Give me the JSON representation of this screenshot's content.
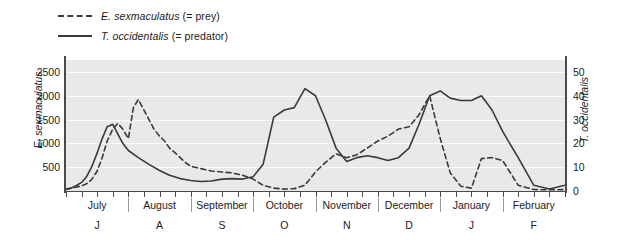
{
  "legend": {
    "items": [
      {
        "key": "dashed",
        "species": "E. sexmaculatus",
        "role": "(= prey)",
        "color": "#3a3a3a"
      },
      {
        "key": "solid",
        "species": "T. occidentalis",
        "role": "(= predator)",
        "color": "#3a3a3a"
      }
    ]
  },
  "chart_data": {
    "type": "line",
    "title": "",
    "xlabel": "",
    "ylabel": "E. sexmaculatus",
    "ylabel_right": "T. occidentalis",
    "ylim": [
      0,
      2750
    ],
    "ylim_right": [
      0,
      55
    ],
    "yticks": [
      500,
      1000,
      1500,
      2000,
      2500
    ],
    "yticks_right": [
      0,
      10,
      20,
      30,
      40,
      50
    ],
    "grid": true,
    "legend_position": "top-left",
    "categories": [
      "July",
      "August",
      "September",
      "October",
      "November",
      "December",
      "January",
      "February"
    ],
    "category_initials": [
      "J",
      "A",
      "S",
      "O",
      "N",
      "D",
      "J",
      "F"
    ],
    "x_tick_count_per_month": 4,
    "series": [
      {
        "name": "E. sexmaculatus",
        "style": "dashed",
        "color": "#3a3a3a",
        "axis": "left",
        "x": [
          0.0,
          0.08,
          0.16,
          0.25,
          0.33,
          0.41,
          0.5,
          0.58,
          0.66,
          0.75,
          0.83,
          0.91,
          1.0,
          1.08,
          1.16,
          1.25,
          1.33,
          1.41,
          1.5,
          1.58,
          1.66,
          1.75,
          1.83,
          1.91,
          2.0,
          2.16,
          2.33,
          2.5,
          2.66,
          2.83,
          3.0,
          3.16,
          3.33,
          3.5,
          3.66,
          3.83,
          4.0,
          4.16,
          4.33,
          4.5,
          4.66,
          4.83,
          5.0,
          5.16,
          5.33,
          5.5,
          5.66,
          5.83,
          6.0,
          6.16,
          6.33,
          6.5,
          6.66,
          6.83,
          7.0,
          7.25,
          7.5,
          7.75,
          8.0
        ],
        "values": [
          40,
          60,
          80,
          110,
          150,
          240,
          420,
          700,
          1050,
          1300,
          1420,
          1300,
          1100,
          1750,
          1920,
          1700,
          1500,
          1300,
          1150,
          1050,
          900,
          800,
          700,
          600,
          520,
          470,
          420,
          400,
          380,
          330,
          250,
          120,
          60,
          40,
          50,
          120,
          400,
          600,
          780,
          700,
          760,
          900,
          1050,
          1150,
          1300,
          1350,
          1600,
          2000,
          1100,
          380,
          100,
          60,
          680,
          700,
          640,
          120,
          30,
          25,
          30
        ],
        "values_detailed_note": "weekly samples July through February"
      },
      {
        "name": "T. occidentalis",
        "style": "solid",
        "color": "#3a3a3a",
        "axis": "right",
        "x": [
          0.0,
          0.08,
          0.16,
          0.25,
          0.33,
          0.41,
          0.5,
          0.58,
          0.66,
          0.75,
          0.83,
          0.91,
          1.0,
          1.16,
          1.33,
          1.5,
          1.66,
          1.83,
          2.0,
          2.16,
          2.33,
          2.5,
          2.66,
          2.83,
          3.0,
          3.16,
          3.33,
          3.5,
          3.66,
          3.83,
          4.0,
          4.16,
          4.33,
          4.5,
          4.66,
          4.83,
          5.0,
          5.16,
          5.33,
          5.5,
          5.66,
          5.83,
          6.0,
          6.16,
          6.33,
          6.5,
          6.66,
          6.83,
          7.0,
          7.25,
          7.5,
          7.75,
          8.0
        ],
        "values_left_scale": [
          30,
          60,
          110,
          180,
          300,
          500,
          800,
          1100,
          1350,
          1400,
          1200,
          1000,
          850,
          700,
          560,
          430,
          330,
          260,
          220,
          200,
          210,
          250,
          260,
          250,
          300,
          560,
          1550,
          1700,
          1750,
          2150,
          2000,
          1500,
          900,
          620,
          700,
          740,
          700,
          640,
          700,
          900,
          1400,
          2000,
          2100,
          1950,
          1900,
          1900,
          2000,
          1700,
          1250,
          700,
          120,
          40,
          120
        ],
        "values_right_scale": [
          0.6,
          1.2,
          2.2,
          3.6,
          6.0,
          10.0,
          16.0,
          22.0,
          27.0,
          28.0,
          24.0,
          20.0,
          17.0,
          14.0,
          11.2,
          8.6,
          6.6,
          5.2,
          4.4,
          4.0,
          4.2,
          5.0,
          5.2,
          5.0,
          6.0,
          11.2,
          31.0,
          34.0,
          35.0,
          43.0,
          40.0,
          30.0,
          18.0,
          12.4,
          14.0,
          14.8,
          14.0,
          12.8,
          14.0,
          18.0,
          28.0,
          40.0,
          42.0,
          39.0,
          38.0,
          38.0,
          40.0,
          34.0,
          25.0,
          14.0,
          2.4,
          0.8,
          2.4
        ]
      }
    ]
  }
}
